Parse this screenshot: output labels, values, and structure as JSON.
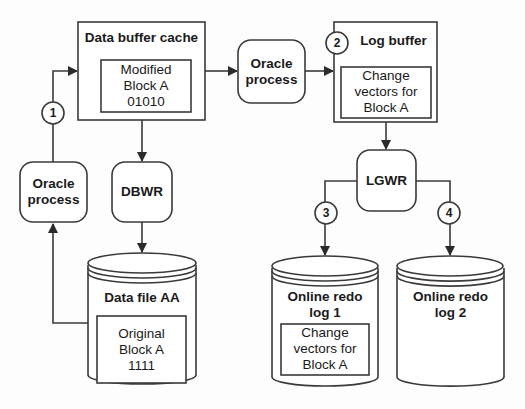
{
  "diagram": {
    "colors": {
      "stroke": "#3a3a3a",
      "fill": "#ffffff",
      "background": "#fdfdfd",
      "text": "#1a1a1a"
    },
    "nodes": {
      "data_buffer_cache": {
        "title": "Data buffer cache",
        "inner": [
          "Modified",
          "Block A",
          "01010"
        ]
      },
      "log_buffer": {
        "title": "Log buffer",
        "inner": [
          "Change",
          "vectors for",
          "Block A"
        ]
      },
      "oracle_process_left": {
        "lines": [
          "Oracle",
          "process"
        ]
      },
      "oracle_process_middle": {
        "lines": [
          "Oracle",
          "process"
        ]
      },
      "dbwr": {
        "label": "DBWR"
      },
      "lgwr": {
        "label": "LGWR"
      },
      "data_file": {
        "title": "Data file AA",
        "inner": [
          "Original",
          "Block A",
          "1111"
        ]
      },
      "online_redo_log_1": {
        "title": [
          "Online redo",
          "log 1"
        ],
        "inner": [
          "Change",
          "vectors for",
          "Block A"
        ]
      },
      "online_redo_log_2": {
        "title": [
          "Online redo",
          "log 2"
        ]
      }
    },
    "steps": [
      "1",
      "2",
      "3",
      "4"
    ],
    "edges": [
      {
        "from": "Data file AA",
        "to": "Oracle process (left)"
      },
      {
        "from": "Oracle process (left)",
        "to": "Data buffer cache",
        "step": "1"
      },
      {
        "from": "Data buffer cache",
        "to": "Oracle process (middle)"
      },
      {
        "from": "Oracle process (middle)",
        "to": "Log buffer",
        "step": "2"
      },
      {
        "from": "Data buffer cache",
        "to": "DBWR"
      },
      {
        "from": "DBWR",
        "to": "Data file AA"
      },
      {
        "from": "Log buffer",
        "to": "LGWR"
      },
      {
        "from": "LGWR",
        "to": "Online redo log 1",
        "step": "3"
      },
      {
        "from": "LGWR",
        "to": "Online redo log 2",
        "step": "4"
      }
    ]
  }
}
